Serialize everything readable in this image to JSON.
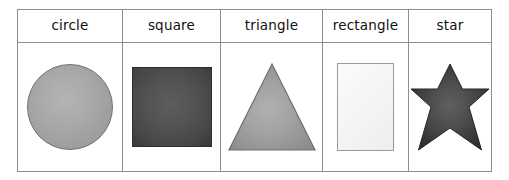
{
  "table": {
    "columns": [
      {
        "header": "circle",
        "shape": "circle-shape",
        "fill_center": "#b4b4b4",
        "fill_edge": "#8f8f8f",
        "stroke": "#6f6f6f"
      },
      {
        "header": "square",
        "shape": "square-shape",
        "fill_center": "#5d5d5d",
        "fill_edge": "#373737",
        "stroke": "#2f2f2f"
      },
      {
        "header": "triangle",
        "shape": "triangle-shape",
        "fill_center": "#a8a8a8",
        "fill_edge": "#8d8d8d",
        "stroke": "#6f6f6f"
      },
      {
        "header": "rectangle",
        "shape": "rectangle-shape",
        "fill_center": "#fbfbfb",
        "fill_edge": "#eeeeee",
        "stroke": "#9a9a9a"
      },
      {
        "header": "star",
        "shape": "six-pointed-star-shape",
        "fill_center": "#5a5a5a",
        "fill_edge": "#2e2e2e",
        "stroke": "#272727"
      }
    ],
    "border_color": "#8e8e8e",
    "background": "#ffffff"
  }
}
